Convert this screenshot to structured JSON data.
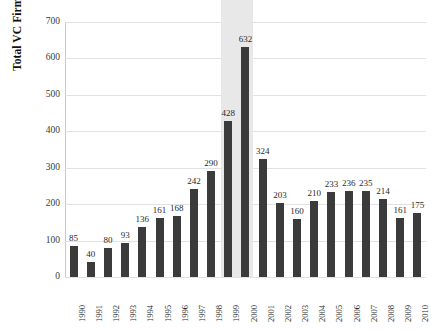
{
  "chart_data": {
    "type": "bar",
    "title": "",
    "subtitle": "",
    "xlabel": "",
    "ylabel": "Total VC Firms",
    "ylim": [
      0,
      700
    ],
    "ytick_values": [
      0,
      100,
      200,
      300,
      400,
      500,
      600,
      700
    ],
    "ytick_labels": [
      "0",
      "100",
      "200",
      "300",
      "400",
      "500",
      "600",
      "700"
    ],
    "grid": true,
    "legend": null,
    "legend_position": "none",
    "bar_color": "#3b3b3b",
    "highlight_color": "#e8e8e8",
    "highlight_categories": [
      "1999",
      "2000"
    ],
    "data_labels_shown": true,
    "categories": [
      "1990",
      "1991",
      "1992",
      "1993",
      "1994",
      "1995",
      "1996",
      "1997",
      "1998",
      "1999",
      "2000",
      "2001",
      "2002",
      "2003",
      "2004",
      "2005",
      "2006",
      "2007",
      "2008",
      "2009",
      "2010"
    ],
    "values": [
      85,
      40,
      80,
      93,
      136,
      161,
      168,
      242,
      290,
      428,
      632,
      324,
      203,
      160,
      210,
      233,
      236,
      235,
      214,
      161,
      175
    ],
    "value_labels": [
      "85",
      "40",
      "80",
      "93",
      "136",
      "161",
      "168",
      "242",
      "290",
      "428",
      "632",
      "324",
      "203",
      "160",
      "210",
      "233",
      "236",
      "235",
      "214",
      "161",
      "175"
    ]
  }
}
